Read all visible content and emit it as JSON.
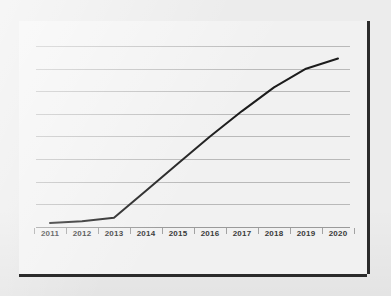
{
  "chart_data": {
    "type": "line",
    "title": "",
    "subtitle": "",
    "xlabel": "",
    "ylabel": "",
    "categories": [
      "2011",
      "2012",
      "2013",
      "2014",
      "2015",
      "2016",
      "2017",
      "2018",
      "2019",
      "2020"
    ],
    "x": [
      2011,
      2012,
      2013,
      2014,
      2015,
      2016,
      2017,
      2018,
      2019,
      2020
    ],
    "series": [
      {
        "name": "Trend",
        "values": [
          3,
          4,
          6,
          22,
          38,
          54,
          69,
          83,
          94,
          100
        ],
        "color": "#1c1c1c",
        "line_width": 2,
        "markers": false
      }
    ],
    "ylim": [
      0,
      108
    ],
    "xlim": [
      2011,
      2020
    ],
    "yticks": [],
    "ytick_labels": [],
    "gridlines": {
      "horizontal": true,
      "vertical": false,
      "count": 8,
      "color": "#b9b9b9"
    },
    "legend": {
      "visible": false,
      "position": "none",
      "entries": []
    },
    "axis": {
      "x_axis_visible": true,
      "y_axis_visible": false,
      "x_tick_marks": true,
      "x_tick_color": "#a2a2a2",
      "axis_color": "#9a9a9a"
    },
    "annotations": []
  },
  "style": {
    "page_background": "#ececec",
    "card_background": "#f1f1f1",
    "card_border_shadow": "#2b2b2b",
    "grid_color": "#b9b9b9",
    "line_color": "#1c1c1c",
    "label_color": "#3a3a3a"
  }
}
